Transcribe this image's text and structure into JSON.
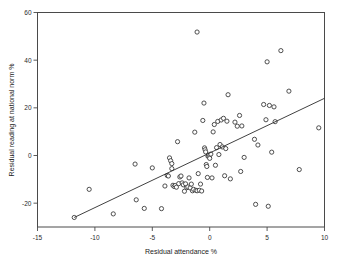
{
  "chart_data": {
    "type": "scatter",
    "title": "",
    "xlabel": "Residual attendance %",
    "ylabel": "Residual reading at national norm %",
    "xlim": [
      -15,
      10
    ],
    "ylim": [
      -30,
      60
    ],
    "xticks": [
      -15,
      -10,
      -5,
      0,
      5,
      10
    ],
    "xtick_labels": [
      "-15",
      "-10",
      "-5",
      "0",
      "5",
      "10"
    ],
    "yticks": [
      -20,
      0,
      20,
      40,
      60
    ],
    "ytick_labels": [
      "-20",
      "0",
      "20",
      "40",
      "60"
    ],
    "grid": false,
    "legend": null,
    "marker": "open-circle",
    "marker_color": "#3c3c3c",
    "line_color": "#2b2b2b",
    "frame_color": "#4a4a4a",
    "background": "#ffffff",
    "fit_line": {
      "type": "linear-regression",
      "x_start": -11.8,
      "y_start": -26.0,
      "x_end": 10.0,
      "y_end": 24.0,
      "slope": 2.29,
      "intercept": 1.0
    },
    "points": [
      [
        -11.8,
        -26.0
      ],
      [
        -10.5,
        -14.2
      ],
      [
        -8.4,
        -24.5
      ],
      [
        -6.5,
        -3.6
      ],
      [
        -6.4,
        -18.6
      ],
      [
        -5.7,
        -22.2
      ],
      [
        -5.0,
        -5.2
      ],
      [
        -4.2,
        -22.3
      ],
      [
        -3.9,
        -12.8
      ],
      [
        -3.7,
        -8.4
      ],
      [
        -3.6,
        -8.6
      ],
      [
        -3.5,
        -1.0
      ],
      [
        -3.4,
        -2.2
      ],
      [
        -3.3,
        -3.4
      ],
      [
        -3.3,
        -5.5
      ],
      [
        -3.2,
        -12.5
      ],
      [
        -3.1,
        -13.0
      ],
      [
        -3.0,
        -12.6
      ],
      [
        -2.9,
        -13.3
      ],
      [
        -2.8,
        5.8
      ],
      [
        -2.7,
        -11.8
      ],
      [
        -2.6,
        -9.0
      ],
      [
        -2.5,
        -8.6
      ],
      [
        -2.4,
        -11.5
      ],
      [
        -2.3,
        -12.3
      ],
      [
        -2.2,
        -15.0
      ],
      [
        -2.1,
        -11.9
      ],
      [
        -2.0,
        -13.5
      ],
      [
        -1.9,
        -13.2
      ],
      [
        -1.8,
        -9.4
      ],
      [
        -1.7,
        -13.6
      ],
      [
        -1.6,
        -12.0
      ],
      [
        -1.5,
        -14.8
      ],
      [
        -1.4,
        -14.2
      ],
      [
        -1.3,
        9.8
      ],
      [
        -1.2,
        -14.6
      ],
      [
        -1.1,
        -14.8
      ],
      [
        -1.1,
        51.8
      ],
      [
        -1.0,
        -7.6
      ],
      [
        -0.9,
        -14.6
      ],
      [
        -0.8,
        -12.0
      ],
      [
        -0.7,
        -14.9
      ],
      [
        -0.6,
        14.7
      ],
      [
        -0.5,
        22.0
      ],
      [
        -0.45,
        3.2
      ],
      [
        -0.4,
        2.4
      ],
      [
        -0.35,
        1.5
      ],
      [
        -0.3,
        -3.8
      ],
      [
        -0.25,
        -4.6
      ],
      [
        -0.2,
        -9.2
      ],
      [
        -0.15,
        -0.3
      ],
      [
        -0.1,
        0.2
      ],
      [
        -0.05,
        -0.6
      ],
      [
        0.0,
        -1.2
      ],
      [
        0.1,
        0.6
      ],
      [
        0.2,
        -9.4
      ],
      [
        0.3,
        9.9
      ],
      [
        0.4,
        13.0
      ],
      [
        0.5,
        -4.1
      ],
      [
        0.6,
        3.3
      ],
      [
        0.7,
        14.3
      ],
      [
        0.8,
        0.4
      ],
      [
        0.9,
        4.6
      ],
      [
        1.0,
        14.9
      ],
      [
        1.1,
        3.6
      ],
      [
        1.2,
        15.6
      ],
      [
        1.3,
        -8.5
      ],
      [
        1.4,
        2.9
      ],
      [
        1.5,
        14.4
      ],
      [
        1.6,
        25.5
      ],
      [
        1.8,
        -9.8
      ],
      [
        2.2,
        14.0
      ],
      [
        2.4,
        12.3
      ],
      [
        2.6,
        16.8
      ],
      [
        2.7,
        -6.7
      ],
      [
        2.8,
        12.4
      ],
      [
        3.0,
        -0.8
      ],
      [
        3.9,
        6.8
      ],
      [
        4.0,
        -20.5
      ],
      [
        4.2,
        4.4
      ],
      [
        4.7,
        21.4
      ],
      [
        4.9,
        15.0
      ],
      [
        5.0,
        39.3
      ],
      [
        5.1,
        -21.3
      ],
      [
        5.2,
        21.0
      ],
      [
        5.4,
        1.4
      ],
      [
        5.6,
        20.4
      ],
      [
        5.7,
        14.2
      ],
      [
        6.2,
        44.0
      ],
      [
        6.9,
        27.0
      ],
      [
        7.8,
        -5.9
      ],
      [
        9.5,
        11.6
      ]
    ]
  }
}
